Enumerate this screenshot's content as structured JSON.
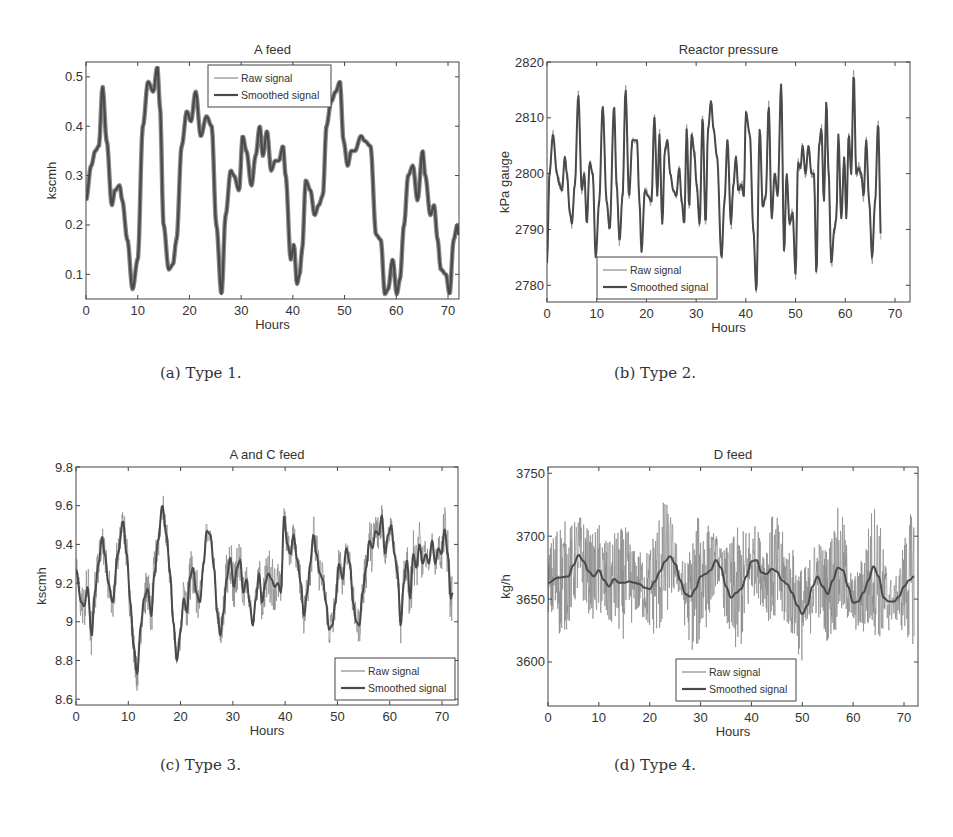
{
  "figure": {
    "captions": [
      "(a) Type 1.",
      "(b) Type 2.",
      "(c) Type 3.",
      "(d) Type 4."
    ]
  },
  "colors": {
    "raw": "#8a8a8a",
    "smoothed": "#4a4a4a",
    "axis": "#444444",
    "text": "#333333"
  },
  "chart_data": [
    {
      "id": "a",
      "type": "line",
      "title": "A feed",
      "xlabel": "Hours",
      "ylabel": "kscmh",
      "xlim": [
        0,
        72
      ],
      "ylim": [
        0.05,
        0.53
      ],
      "xticks": [
        0,
        10,
        20,
        30,
        40,
        50,
        60,
        70
      ],
      "yticks": [
        0.1,
        0.2,
        0.3,
        0.4,
        0.5
      ],
      "ytick_labels": [
        "0.1",
        "0.2",
        "0.3",
        "0.4",
        "0.5"
      ],
      "grid": false,
      "legend": {
        "position": "upper center",
        "entries": [
          "Raw signal",
          "Smoothed signal"
        ]
      },
      "raw_noise": 0.0,
      "series": [
        {
          "name": "Smoothed signal",
          "x": [
            0,
            1,
            1.8,
            2.5,
            3.2,
            4,
            5,
            5.6,
            6.5,
            7,
            8,
            9,
            10,
            11,
            12,
            13,
            13.8,
            14.3,
            15,
            16,
            16.8,
            17.5,
            18.5,
            19.5,
            20.3,
            21.2,
            22.2,
            23.3,
            24.3,
            25.2,
            26.2,
            27,
            28,
            28.6,
            29.6,
            30.3,
            31,
            32,
            32.8,
            33.6,
            34.2,
            35,
            35.8,
            36.6,
            37.3,
            38.1,
            38.6,
            39.6,
            40.2,
            40.8,
            41.3,
            41.8,
            42.5,
            43.4,
            44.2,
            45,
            45.8,
            46.5,
            47.4,
            48.3,
            49.1,
            49.8,
            50.6,
            51.3,
            52,
            53.2,
            53.9,
            55,
            56.1,
            57,
            57.8,
            58.4,
            59.3,
            60.1,
            60.7,
            61.5,
            62.3,
            63.2,
            64.1,
            65.1,
            65.6,
            66.6,
            67.3,
            68,
            68.6,
            69.6,
            70.3,
            71.1,
            71.8,
            72
          ],
          "values": [
            0.25,
            0.32,
            0.35,
            0.36,
            0.48,
            0.37,
            0.24,
            0.27,
            0.28,
            0.25,
            0.17,
            0.07,
            0.13,
            0.4,
            0.49,
            0.47,
            0.52,
            0.44,
            0.2,
            0.11,
            0.12,
            0.17,
            0.36,
            0.43,
            0.41,
            0.47,
            0.38,
            0.42,
            0.4,
            0.2,
            0.06,
            0.22,
            0.31,
            0.3,
            0.27,
            0.38,
            0.35,
            0.28,
            0.34,
            0.4,
            0.34,
            0.39,
            0.31,
            0.33,
            0.33,
            0.36,
            0.3,
            0.13,
            0.16,
            0.08,
            0.1,
            0.15,
            0.29,
            0.27,
            0.22,
            0.24,
            0.26,
            0.4,
            0.45,
            0.47,
            0.49,
            0.37,
            0.32,
            0.35,
            0.35,
            0.38,
            0.37,
            0.36,
            0.18,
            0.17,
            0.06,
            0.07,
            0.13,
            0.06,
            0.09,
            0.2,
            0.3,
            0.32,
            0.25,
            0.35,
            0.3,
            0.22,
            0.24,
            0.17,
            0.11,
            0.1,
            0.06,
            0.17,
            0.2,
            0.18
          ]
        }
      ]
    },
    {
      "id": "b",
      "type": "line",
      "title": "Reactor pressure",
      "xlabel": "Hours",
      "ylabel": "kPa gauge",
      "xlim": [
        0,
        72
      ],
      "ylim": [
        2777,
        2820
      ],
      "xticks": [
        0,
        10,
        20,
        30,
        40,
        50,
        60,
        70
      ],
      "yticks": [
        2780,
        2790,
        2800,
        2810,
        2820
      ],
      "ytick_labels": [
        "2780",
        "2790",
        "2800",
        "2810",
        "2820"
      ],
      "grid": false,
      "legend": {
        "position": "lower left",
        "entries": [
          "Raw signal",
          "Smoothed signal"
        ]
      },
      "raw_noise": 1.2,
      "series": [
        {
          "name": "Smoothed signal",
          "x": [
            0,
            0.5,
            1.2,
            2,
            2.5,
            3,
            3.6,
            4,
            4.6,
            5,
            5.6,
            6.3,
            7,
            7.5,
            8,
            8.6,
            9.2,
            9.8,
            10.5,
            11.2,
            12,
            12.6,
            13.5,
            14,
            14.6,
            15.2,
            15.8,
            16.5,
            17.2,
            18.1,
            18.6,
            19,
            19.7,
            20.3,
            21,
            21.6,
            22.2,
            22.6,
            23.2,
            23.7,
            24.2,
            24.8,
            25.4,
            26,
            26.6,
            27.1,
            27.6,
            28.1,
            28.6,
            29.1,
            29.6,
            30.1,
            30.7,
            31.3,
            31.9,
            32.4,
            33,
            33.5,
            34.2,
            35.1,
            35.7,
            36.3,
            37,
            37.5,
            38,
            38.5,
            39.1,
            39.6,
            40,
            40.8,
            41.5,
            42.1,
            42.8,
            43.4,
            44,
            44.6,
            45.2,
            45.8,
            46.4,
            47.1,
            47.7,
            48.2,
            48.8,
            49.4,
            50,
            50.5,
            51,
            51.4,
            52,
            52.6,
            53.2,
            53.7,
            54.2,
            54.7,
            55.2,
            55.7,
            56.2,
            56.6,
            57.2,
            57.8,
            58.2,
            58.6,
            59.2,
            59.8,
            60.2,
            60.7,
            61.2,
            61.7,
            62.2,
            62.7,
            63.2,
            63.7,
            64.2,
            64.8,
            65.4,
            66,
            66.6,
            67.2,
            67.8,
            68.4,
            69,
            69.6,
            70.2,
            70.7,
            71.2,
            71.7,
            72
          ],
          "values": [
            2784,
            2800,
            2807,
            2800,
            2798,
            2797,
            2803,
            2800,
            2793,
            2791,
            2798,
            2814,
            2797,
            2800,
            2791,
            2802,
            2800,
            2785,
            2795,
            2812,
            2795,
            2790,
            2812,
            2798,
            2788,
            2796,
            2815,
            2796,
            2806,
            2806,
            2795,
            2786,
            2797,
            2796,
            2795,
            2810,
            2796,
            2807,
            2791,
            2804,
            2806,
            2800,
            2797,
            2796,
            2801,
            2795,
            2791,
            2808,
            2794,
            2807,
            2804,
            2798,
            2791,
            2810,
            2791,
            2808,
            2813,
            2808,
            2803,
            2785,
            2795,
            2806,
            2791,
            2798,
            2803,
            2797,
            2798,
            2796,
            2811,
            2807,
            2790,
            2779,
            2808,
            2794,
            2796,
            2812,
            2792,
            2800,
            2796,
            2816,
            2786,
            2800,
            2791,
            2793,
            2782,
            2802,
            2801,
            2805,
            2800,
            2805,
            2800,
            2800,
            2782,
            2805,
            2808,
            2795,
            2813,
            2801,
            2784,
            2790,
            2792,
            2807,
            2792,
            2803,
            2792,
            2807,
            2800,
            2818,
            2800,
            2801,
            2800,
            2796,
            2806,
            2795,
            2785,
            2795,
            2809,
            2788
          ]
        }
      ]
    },
    {
      "id": "c",
      "type": "line",
      "title": "A and C feed",
      "xlabel": "Hours",
      "ylabel": "kscmh",
      "xlim": [
        0,
        73
      ],
      "ylim": [
        8.57,
        9.8
      ],
      "xticks": [
        0,
        10,
        20,
        30,
        40,
        50,
        60,
        70
      ],
      "yticks": [
        8.6,
        8.8,
        9.0,
        9.2,
        9.4,
        9.6,
        9.8
      ],
      "ytick_labels": [
        "8.6",
        "8.8",
        "9",
        "9.2",
        "9.4",
        "9.6",
        "9.8"
      ],
      "grid": false,
      "legend": {
        "position": "lower right",
        "entries": [
          "Raw signal",
          "Smoothed signal"
        ]
      },
      "raw_noise": 0.12,
      "series": [
        {
          "name": "Smoothed signal",
          "x": [
            0,
            1,
            1.6,
            2.2,
            3,
            3.6,
            4.3,
            5,
            5.5,
            6.2,
            7,
            8,
            9,
            9.7,
            10.4,
            11,
            11.7,
            12.4,
            13,
            13.7,
            14.4,
            15,
            15.7,
            16.5,
            17.3,
            18,
            18.6,
            19.3,
            20,
            20.6,
            21.2,
            21.8,
            22.4,
            23,
            23.7,
            24.4,
            25,
            25.7,
            26.4,
            27,
            27.6,
            28.2,
            28.8,
            29.5,
            30.2,
            30.8,
            31.4,
            32,
            32.6,
            33.2,
            33.8,
            34.4,
            35,
            35.6,
            36.2,
            36.8,
            37.4,
            38,
            38.6,
            39.2,
            39.8,
            40.4,
            41,
            41.6,
            42.3,
            43,
            43.6,
            44.2,
            44.8,
            45.4,
            46,
            46.6,
            47.2,
            47.8,
            48.4,
            49,
            49.6,
            50.3,
            51,
            51.7,
            52.4,
            53,
            53.6,
            54.2,
            54.8,
            55.5,
            56.1,
            56.7,
            57.3,
            57.9,
            58.5,
            59.1,
            59.7,
            60.3,
            60.9,
            61.5,
            62.1,
            62.7,
            63.3,
            63.9,
            64.5,
            65.1,
            65.7,
            66.3,
            66.9,
            67.5,
            68.1,
            68.7,
            69.3,
            69.9,
            70.5,
            71.1,
            71.7,
            72
          ],
          "values": [
            9.27,
            9.1,
            9.08,
            9.18,
            8.93,
            9.15,
            9.3,
            9.44,
            9.35,
            9.2,
            9.1,
            9.35,
            9.52,
            9.35,
            9.1,
            8.88,
            8.73,
            8.98,
            9.12,
            9.17,
            9.03,
            9.25,
            9.42,
            9.6,
            9.45,
            9.25,
            9.0,
            8.8,
            8.95,
            9.12,
            9.05,
            9.23,
            9.28,
            9.15,
            9.1,
            9.3,
            9.47,
            9.45,
            9.28,
            9.05,
            8.93,
            9.05,
            9.22,
            9.33,
            9.18,
            9.28,
            9.32,
            9.15,
            9.22,
            9.1,
            8.98,
            9.12,
            9.25,
            9.1,
            9.2,
            9.25,
            9.22,
            9.18,
            9.2,
            9.15,
            9.55,
            9.4,
            9.35,
            9.45,
            9.32,
            9.2,
            9.03,
            9.15,
            9.3,
            9.45,
            9.35,
            9.25,
            9.22,
            9.1,
            8.96,
            8.98,
            9.1,
            9.3,
            9.22,
            9.38,
            9.3,
            9.1,
            9.0,
            8.98,
            9.15,
            9.28,
            9.42,
            9.38,
            9.47,
            9.45,
            9.55,
            9.35,
            9.45,
            9.5,
            9.35,
            9.25,
            8.98,
            9.2,
            9.32,
            9.12,
            9.35,
            9.28,
            9.4,
            9.3,
            9.35,
            9.3,
            9.42,
            9.3,
            9.38,
            9.35,
            9.48,
            9.35,
            9.12,
            9.15,
            9.22
          ]
        }
      ]
    },
    {
      "id": "d",
      "type": "line",
      "title": "D feed",
      "xlabel": "Hours",
      "ylabel": "kg/h",
      "xlim": [
        0,
        73
      ],
      "ylim": [
        3565,
        3755
      ],
      "xticks": [
        0,
        10,
        20,
        30,
        40,
        50,
        60,
        70
      ],
      "yticks": [
        3600,
        3650,
        3700,
        3750
      ],
      "ytick_labels": [
        "3600",
        "3650",
        "3700",
        "3750"
      ],
      "grid": false,
      "legend": {
        "position": "lower center",
        "entries": [
          "Raw signal",
          "Smoothed signal"
        ]
      },
      "raw_noise": 45,
      "series": [
        {
          "name": "Smoothed signal",
          "x": [
            0,
            2,
            4,
            5,
            6,
            7,
            8,
            9,
            10,
            11,
            12,
            13,
            14,
            15,
            16,
            17,
            18,
            19,
            20,
            21,
            22,
            23,
            24,
            25,
            26,
            27,
            28,
            29,
            30,
            31,
            32,
            33,
            34,
            35,
            36,
            37,
            38,
            39,
            40,
            41,
            42,
            43,
            44,
            45,
            46,
            47,
            48,
            49,
            50,
            51,
            52,
            53,
            54,
            55,
            56,
            57,
            58,
            59,
            60,
            61,
            62,
            63,
            64,
            65,
            66,
            67,
            68,
            69,
            70,
            71,
            72
          ],
          "values": [
            3663,
            3667,
            3668,
            3677,
            3685,
            3680,
            3672,
            3668,
            3673,
            3665,
            3660,
            3666,
            3663,
            3663,
            3664,
            3663,
            3662,
            3659,
            3658,
            3664,
            3672,
            3680,
            3684,
            3678,
            3665,
            3654,
            3652,
            3658,
            3668,
            3670,
            3673,
            3681,
            3675,
            3660,
            3651,
            3655,
            3658,
            3668,
            3680,
            3681,
            3671,
            3670,
            3674,
            3672,
            3665,
            3662,
            3655,
            3645,
            3638,
            3645,
            3660,
            3668,
            3660,
            3654,
            3665,
            3675,
            3673,
            3660,
            3647,
            3648,
            3655,
            3665,
            3676,
            3668,
            3651,
            3648,
            3648,
            3652,
            3660,
            3665,
            3668
          ]
        }
      ]
    }
  ],
  "panels": [
    {
      "chart": 0,
      "svg": {
        "left": 30,
        "top": 30,
        "width": 440,
        "height": 320
      },
      "plot": {
        "x0": 86,
        "y0": 62,
        "x1": 459,
        "y1": 299
      },
      "x70px": 448,
      "legend": {
        "x": 208,
        "y": 65,
        "w": 123,
        "h": 42
      },
      "caption": {
        "x": 160,
        "y": 364
      }
    },
    {
      "chart": 1,
      "svg": {
        "left": 470,
        "top": 30,
        "width": 460,
        "height": 320
      },
      "plot": {
        "x0": 547,
        "y0": 62,
        "x1": 910,
        "y1": 302
      },
      "x70px": 895,
      "legend": {
        "x": 597,
        "y": 257,
        "w": 120,
        "h": 42
      },
      "caption": {
        "x": 614,
        "y": 364
      }
    },
    {
      "chart": 2,
      "svg": {
        "left": 30,
        "top": 430,
        "width": 440,
        "height": 320
      },
      "plot": {
        "x0": 76,
        "y0": 467,
        "x1": 458,
        "y1": 705
      },
      "x70px": 442,
      "legend": {
        "x": 335,
        "y": 658,
        "w": 120,
        "h": 42
      },
      "caption": {
        "x": 160,
        "y": 756
      }
    },
    {
      "chart": 3,
      "svg": {
        "left": 470,
        "top": 430,
        "width": 460,
        "height": 320
      },
      "plot": {
        "x0": 548,
        "y0": 467,
        "x1": 918,
        "y1": 706
      },
      "x70px": 904,
      "legend": {
        "x": 676,
        "y": 659,
        "w": 120,
        "h": 42
      },
      "caption": {
        "x": 614,
        "y": 756
      }
    }
  ]
}
